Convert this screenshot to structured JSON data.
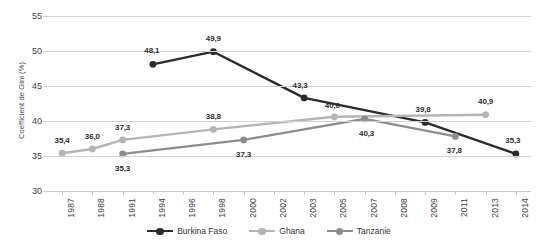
{
  "chart_data": {
    "type": "line",
    "title": "",
    "xlabel": "",
    "ylabel": "Coefficient de Gini (%)",
    "ylim": [
      30,
      55
    ],
    "yticks": [
      "30",
      "35",
      "40",
      "45",
      "50",
      "55"
    ],
    "grid": true,
    "legend_position": "bottom",
    "categories": [
      "1987",
      "1988",
      "1991",
      "1994",
      "1996",
      "1998",
      "2000",
      "2002",
      "2003",
      "2005",
      "2007",
      "2008",
      "2009",
      "2011",
      "2013",
      "2014"
    ],
    "series": [
      {
        "name": "Burkina Faso",
        "color": "#2b2b2b",
        "points": [
          {
            "x": "1994",
            "y": 48.1,
            "label": "48,1"
          },
          {
            "x": "1998",
            "y": 49.9,
            "label": "49,9"
          },
          {
            "x": "2003",
            "y": 43.3,
            "label": "43,3"
          },
          {
            "x": "2009",
            "y": 39.8,
            "label": "39,8"
          },
          {
            "x": "2014",
            "y": 35.3,
            "label": "35,3"
          }
        ]
      },
      {
        "name": "Ghana",
        "color": "#b5b5b5",
        "points": [
          {
            "x": "1987",
            "y": 35.4,
            "label": "35,4"
          },
          {
            "x": "1988",
            "y": 36.0,
            "label": "36,0"
          },
          {
            "x": "1991",
            "y": 37.3,
            "label": "37,3"
          },
          {
            "x": "1998",
            "y": 38.8,
            "label": "38,8"
          },
          {
            "x": "2005",
            "y": 40.6,
            "label": "40,6"
          },
          {
            "x": "2013",
            "y": 40.9,
            "label": "40,9"
          }
        ]
      },
      {
        "name": "Tanzanie",
        "color": "#8d8d8d",
        "points": [
          {
            "x": "1991",
            "y": 35.3,
            "label": "35,3"
          },
          {
            "x": "2000",
            "y": 37.3,
            "label": "37,3"
          },
          {
            "x": "2007",
            "y": 40.3,
            "label": "40,3"
          },
          {
            "x": "2011",
            "y": 37.8,
            "label": "37,8"
          }
        ]
      }
    ],
    "value_labels": [
      {
        "text": "35,4",
        "series": "Ghana",
        "x": "1987",
        "y": 35.4,
        "dx": 0,
        "dy": -13
      },
      {
        "text": "36,0",
        "series": "Ghana",
        "x": "1988",
        "y": 36.0,
        "dx": 0,
        "dy": -13
      },
      {
        "text": "37,3",
        "series": "Ghana",
        "x": "1991",
        "y": 37.3,
        "dx": 0,
        "dy": -13
      },
      {
        "text": "38,8",
        "series": "Ghana",
        "x": "1998",
        "y": 38.8,
        "dx": 0,
        "dy": -13
      },
      {
        "text": "40,6",
        "series": "Ghana",
        "x": "2005",
        "y": 40.6,
        "dx": -2,
        "dy": -12
      },
      {
        "text": "40,9",
        "series": "Ghana",
        "x": "2013",
        "y": 40.9,
        "dx": 0,
        "dy": -14
      },
      {
        "text": "48,1",
        "series": "Burkina Faso",
        "x": "1994",
        "y": 48.1,
        "dx": -1,
        "dy": -14
      },
      {
        "text": "49,9",
        "series": "Burkina Faso",
        "x": "1998",
        "y": 49.9,
        "dx": 0,
        "dy": -14
      },
      {
        "text": "43,3",
        "series": "Burkina Faso",
        "x": "2003",
        "y": 43.3,
        "dx": -4,
        "dy": -13
      },
      {
        "text": "39,8",
        "series": "Burkina Faso",
        "x": "2009",
        "y": 39.8,
        "dx": -2,
        "dy": -13
      },
      {
        "text": "35,3",
        "series": "Burkina Faso",
        "x": "2014",
        "y": 35.3,
        "dx": -3,
        "dy": -14
      },
      {
        "text": "35,3",
        "series": "Tanzanie",
        "x": "1991",
        "y": 35.3,
        "dx": 0,
        "dy": 14
      },
      {
        "text": "37,3",
        "series": "Tanzanie",
        "x": "2000",
        "y": 37.3,
        "dx": 0,
        "dy": 14
      },
      {
        "text": "40,3",
        "series": "Tanzanie",
        "x": "2007",
        "y": 40.3,
        "dx": 2,
        "dy": 14
      },
      {
        "text": "37,8",
        "series": "Tanzanie",
        "x": "2011",
        "y": 37.8,
        "dx": -1,
        "dy": 14
      }
    ]
  }
}
